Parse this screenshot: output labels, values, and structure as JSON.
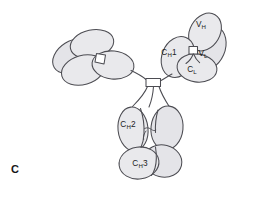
{
  "figure": {
    "panel_letter": "C",
    "background_color": "#ffffff",
    "domain_fill_color": "#e9e9ec",
    "outline_color": "#4c4c52",
    "label_color": "#1c1c1c",
    "width": 278,
    "height": 197
  },
  "labels": {
    "vh": {
      "main": "V",
      "sub": "H",
      "full": "VH"
    },
    "vl": {
      "main": "V",
      "sub": "L",
      "full": "VL"
    },
    "ch1": {
      "main": "C",
      "sub": "H",
      "tail": "1",
      "full": "CH1"
    },
    "cl": {
      "main": "C",
      "sub": "L",
      "full": "CL"
    },
    "ch2": {
      "main": "C",
      "sub": "H",
      "tail": "2",
      "full": "CH2"
    },
    "ch3": {
      "main": "C",
      "sub": "H",
      "tail": "3",
      "full": "CH3"
    }
  },
  "structure": {
    "arms": [
      {
        "name": "left-fab-arm",
        "labeled": false,
        "domain_count": 4
      },
      {
        "name": "right-fab-arm",
        "labeled": true,
        "domains": [
          "VH",
          "VL",
          "CH1",
          "CL"
        ]
      }
    ],
    "fc_region": {
      "name": "fc-stem",
      "domains": [
        "CH2",
        "CH2",
        "CH3",
        "CH3"
      ]
    },
    "bonds": [
      {
        "name": "hinge-disulfide-bond",
        "shape": "rectangle"
      },
      {
        "name": "left-arm-interchain-bond",
        "shape": "quadrilateral"
      },
      {
        "name": "right-arm-vh-vl-bond",
        "shape": "rectangle"
      }
    ],
    "carbohydrate": {
      "name": "carbohydrate-chain",
      "between": "CH2-CH2"
    }
  }
}
